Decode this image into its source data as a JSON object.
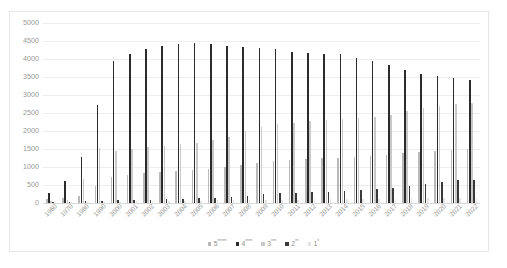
{
  "title": "",
  "legend": {
    "position": "bottom",
    "items": [
      {
        "label": "5",
        "stars": "*****",
        "color": "#b9b9b9",
        "name": "5*****"
      },
      {
        "label": "4",
        "stars": "****",
        "color": "#2b2b2b",
        "name": "4****"
      },
      {
        "label": "3",
        "stars": "***",
        "color": "#c9c9c9",
        "name": "3***"
      },
      {
        "label": "2",
        "stars": "**",
        "color": "#3a3a3a",
        "name": "2**"
      },
      {
        "label": "1",
        "stars": "*",
        "color": "#e4e4e4",
        "name": "1*"
      }
    ]
  },
  "chart_data": {
    "type": "bar",
    "title": "",
    "xlabel": "",
    "ylabel": "",
    "ylim": [
      0,
      5000
    ],
    "yticks": [
      0,
      500,
      1000,
      1500,
      2000,
      2500,
      3000,
      3500,
      4000,
      4500,
      5000
    ],
    "ytick_labels": [
      "0",
      "500",
      "1000",
      "1500",
      "2000",
      "2500",
      "3000",
      "3500",
      "4000",
      "4500",
      "5000"
    ],
    "grid": true,
    "legend_position": "bottom",
    "categories": [
      "1960",
      "1970",
      "1980",
      "1990",
      "2000",
      "2001",
      "2002",
      "2003",
      "2004",
      "2005",
      "2006",
      "2007",
      "2008",
      "2009",
      "2010",
      "2011",
      "2012",
      "2013",
      "2014",
      "2015",
      "2016",
      "2017",
      "2018",
      "2019",
      "2020",
      "2021",
      "2022"
    ],
    "series": [
      {
        "name": "5*****",
        "color": "#b9b9b9",
        "values": [
          110,
          140,
          200,
          460,
          730,
          790,
          840,
          860,
          900,
          930,
          950,
          1000,
          1060,
          1120,
          1180,
          1200,
          1220,
          1240,
          1260,
          1290,
          1310,
          1340,
          1380,
          1420,
          1450,
          1480,
          1500
        ]
      },
      {
        "name": "4****",
        "color": "#2b2b2b",
        "values": [
          280,
          620,
          1280,
          2710,
          3940,
          4150,
          4290,
          4370,
          4420,
          4450,
          4420,
          4350,
          4320,
          4300,
          4280,
          4200,
          4160,
          4130,
          4130,
          4030,
          3940,
          3830,
          3700,
          3580,
          3530,
          3470,
          3430
        ]
      },
      {
        "name": "3***",
        "color": "#c9c9c9",
        "values": [
          60,
          90,
          680,
          1520,
          1440,
          1500,
          1560,
          1580,
          1630,
          1660,
          1750,
          1840,
          2000,
          2120,
          2200,
          2220,
          2270,
          2300,
          2340,
          2370,
          2400,
          2450,
          2560,
          2640,
          2700,
          2760,
          2780
        ]
      },
      {
        "name": "2**",
        "color": "#3a3a3a",
        "values": [
          30,
          40,
          50,
          60,
          70,
          80,
          95,
          105,
          120,
          130,
          145,
          165,
          200,
          250,
          280,
          290,
          300,
          310,
          340,
          370,
          390,
          430,
          480,
          530,
          580,
          630,
          640
        ]
      },
      {
        "name": "1*",
        "color": "#e4e4e4",
        "values": [
          20,
          25,
          30,
          35,
          40,
          45,
          50,
          55,
          60,
          65,
          70,
          75,
          80,
          85,
          90,
          95,
          100,
          105,
          110,
          115,
          120,
          125,
          130,
          135,
          140,
          145,
          150
        ]
      }
    ]
  }
}
